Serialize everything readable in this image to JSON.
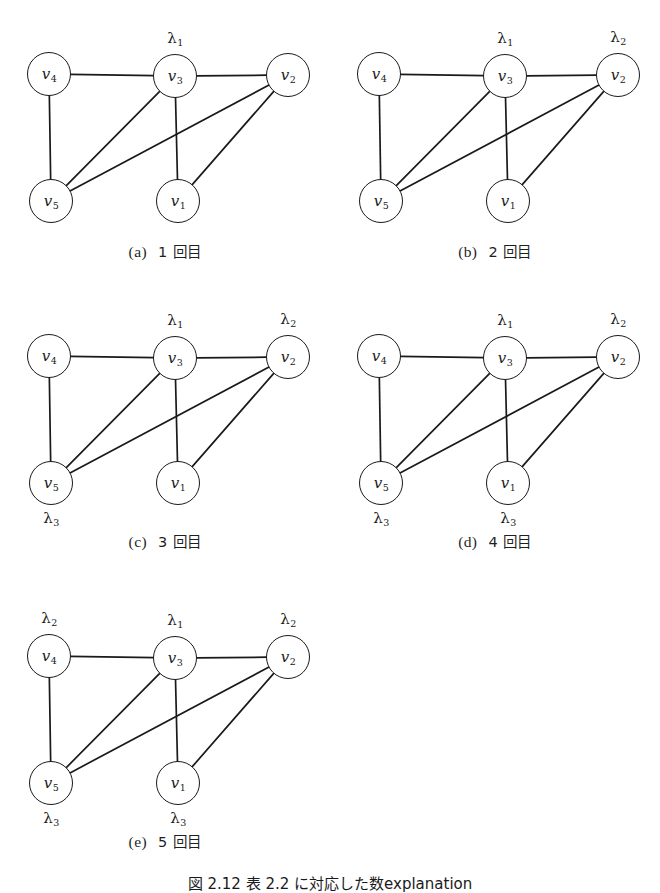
{
  "figure": {
    "caption_number": "図 2.12",
    "caption_text": "表 2.2 に対応した数explanation",
    "caption_visible": "図 2.12  表 2.2 に対応した数explanation",
    "node_radius": 22,
    "colors": {
      "ink": "#1a1a1a",
      "paper": "#ffffff",
      "edge": "#1a1a1a"
    }
  },
  "graph": {
    "nodes": [
      {
        "id": "v4",
        "label": "v",
        "sub": "4",
        "x": 49,
        "y": 66
      },
      {
        "id": "v3",
        "label": "v",
        "sub": "3",
        "x": 175,
        "y": 68
      },
      {
        "id": "v2",
        "label": "v",
        "sub": "2",
        "x": 288,
        "y": 67
      },
      {
        "id": "v5",
        "label": "v",
        "sub": "5",
        "x": 51,
        "y": 193
      },
      {
        "id": "v1",
        "label": "v",
        "sub": "1",
        "x": 178,
        "y": 193
      }
    ],
    "edges": [
      {
        "from": "v4",
        "to": "v3"
      },
      {
        "from": "v3",
        "to": "v2"
      },
      {
        "from": "v4",
        "to": "v5"
      },
      {
        "from": "v3",
        "to": "v5"
      },
      {
        "from": "v3",
        "to": "v1"
      },
      {
        "from": "v2",
        "to": "v5"
      },
      {
        "from": "v2",
        "to": "v1"
      }
    ]
  },
  "panels": [
    {
      "key": "a",
      "tag": "(a)",
      "caption": "1 回目",
      "origin_x": 0,
      "origin_y": 8,
      "caption_y": 232,
      "labels": [
        {
          "node": "v3",
          "lam": "λ",
          "sub": "1",
          "pos": "above"
        }
      ]
    },
    {
      "key": "b",
      "tag": "(b)",
      "caption": "2 回目",
      "origin_x": 330,
      "origin_y": 8,
      "caption_y": 232,
      "labels": [
        {
          "node": "v3",
          "lam": "λ",
          "sub": "1",
          "pos": "above"
        },
        {
          "node": "v2",
          "lam": "λ",
          "sub": "2",
          "pos": "above"
        }
      ]
    },
    {
      "key": "c",
      "tag": "(c)",
      "caption": "3 回目",
      "origin_x": 0,
      "origin_y": 290,
      "caption_y": 240,
      "labels": [
        {
          "node": "v3",
          "lam": "λ",
          "sub": "1",
          "pos": "above"
        },
        {
          "node": "v2",
          "lam": "λ",
          "sub": "2",
          "pos": "above"
        },
        {
          "node": "v5",
          "lam": "λ",
          "sub": "3",
          "pos": "below"
        }
      ]
    },
    {
      "key": "d",
      "tag": "(d)",
      "caption": "4 回目",
      "origin_x": 330,
      "origin_y": 290,
      "caption_y": 240,
      "labels": [
        {
          "node": "v3",
          "lam": "λ",
          "sub": "1",
          "pos": "above"
        },
        {
          "node": "v2",
          "lam": "λ",
          "sub": "2",
          "pos": "above"
        },
        {
          "node": "v5",
          "lam": "λ",
          "sub": "3",
          "pos": "below"
        },
        {
          "node": "v1",
          "lam": "λ",
          "sub": "3",
          "pos": "below"
        }
      ]
    },
    {
      "key": "e",
      "tag": "(e)",
      "caption": "5 回目",
      "origin_x": 0,
      "origin_y": 590,
      "caption_y": 240,
      "labels": [
        {
          "node": "v4",
          "lam": "λ",
          "sub": "2",
          "pos": "above"
        },
        {
          "node": "v3",
          "lam": "λ",
          "sub": "1",
          "pos": "above"
        },
        {
          "node": "v2",
          "lam": "λ",
          "sub": "2",
          "pos": "above"
        },
        {
          "node": "v5",
          "lam": "λ",
          "sub": "3",
          "pos": "below"
        },
        {
          "node": "v1",
          "lam": "λ",
          "sub": "3",
          "pos": "below"
        }
      ]
    }
  ]
}
